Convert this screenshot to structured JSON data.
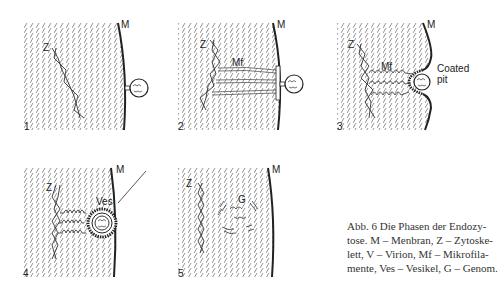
{
  "figure": {
    "panels": [
      {
        "number": "1",
        "labels": {
          "membrane": "M",
          "cytoskeleton": "Z"
        }
      },
      {
        "number": "2",
        "labels": {
          "membrane": "M",
          "cytoskeleton": "Z",
          "microfilaments": "Mf"
        }
      },
      {
        "number": "3",
        "labels": {
          "membrane": "M",
          "cytoskeleton": "Z",
          "microfilaments": "Mf",
          "coated_pit_line1": "Coated",
          "coated_pit_line2": "pit"
        }
      },
      {
        "number": "4",
        "labels": {
          "membrane": "M",
          "cytoskeleton": "Z",
          "vesicle": "Ves"
        }
      },
      {
        "number": "5",
        "labels": {
          "membrane": "M",
          "cytoskeleton": "Z",
          "genome": "G"
        }
      }
    ],
    "caption": {
      "lines": [
        "Abb. 6   Die Phasen der Endozy-",
        "tose. M – Menbran, Z – Zytoske-",
        "lett, V – Virion, Mf – Mikrofila-",
        "mente, Ves – Vesikel, G – Genom."
      ]
    }
  }
}
